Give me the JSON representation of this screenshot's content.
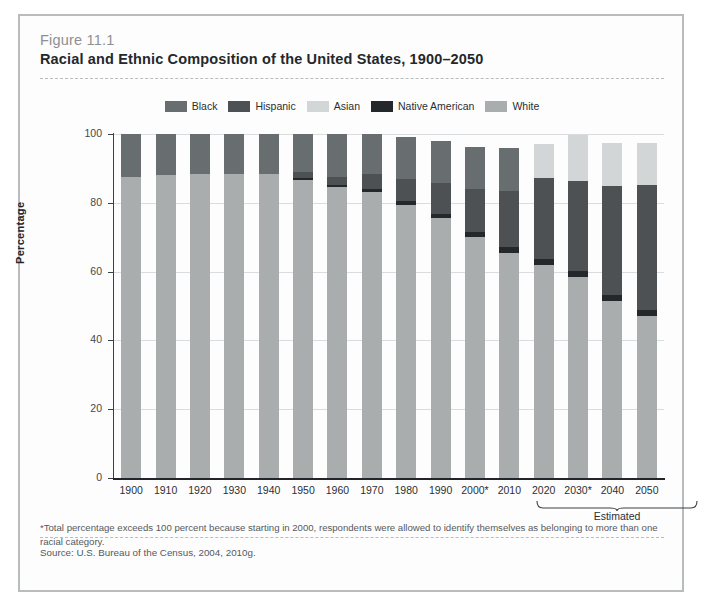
{
  "figure": {
    "number": "Figure 11.1",
    "title": "Racial and Ethnic Composition of the United States, 1900–2050",
    "footnote": "*Total percentage exceeds 100 percent because starting in 2000, respondents were allowed to identify themselves as belonging to more than one racial category.",
    "source": "Source: U.S. Bureau of the Census, 2004, 2010g.",
    "estimated_label": "Estimated"
  },
  "colors": {
    "black": "#686d70",
    "hispanic": "#4d5154",
    "asian": "#d3d6d7",
    "native_american": "#25282b",
    "white": "#a9adae",
    "frame": "#b9bcbd",
    "axis": "#22262a",
    "grid": "#dadddf"
  },
  "chart_data": {
    "type": "bar",
    "subtype": "stacked-vertical",
    "title": "Racial and Ethnic Composition of the United States, 1900–2050",
    "xlabel": "",
    "ylabel": "Percentage",
    "ylim": [
      0,
      100
    ],
    "yticks": [
      0,
      20,
      40,
      60,
      80,
      100
    ],
    "grid": true,
    "legend_position": "top-center",
    "categories": [
      "1900",
      "1910",
      "1920",
      "1930",
      "1940",
      "1950",
      "1960",
      "1970",
      "1980",
      "1990",
      "2000*",
      "2010",
      "2020",
      "2030*",
      "2040",
      "2050"
    ],
    "estimated_categories": [
      "2020",
      "2030*",
      "2040",
      "2050"
    ],
    "stack_order_bottom_to_top": [
      "White",
      "Native American",
      "Hispanic",
      "Black",
      "Asian"
    ],
    "series": [
      {
        "name": "White",
        "color": "#a9adae",
        "values": [
          87.5,
          88.0,
          88.5,
          88.5,
          88.5,
          86.5,
          84.5,
          83.0,
          79.5,
          75.5,
          70.0,
          65.5,
          62.0,
          58.5,
          51.5,
          47.0
        ]
      },
      {
        "name": "Native American",
        "color": "#25282b",
        "values": [
          0,
          0,
          0,
          0,
          0,
          0.7,
          0.8,
          0.9,
          1.0,
          1.2,
          1.5,
          1.6,
          1.6,
          1.7,
          1.8,
          1.8
        ]
      },
      {
        "name": "Hispanic",
        "color": "#4d5154",
        "values": [
          0,
          0,
          0,
          0,
          0,
          1.8,
          2.2,
          4.5,
          6.5,
          9.0,
          12.5,
          16.3,
          23.5,
          26.0,
          31.5,
          36.5
        ]
      },
      {
        "name": "Black",
        "color": "#686d70",
        "values": [
          12.5,
          12.0,
          11.5,
          11.5,
          11.5,
          11.0,
          12.5,
          11.6,
          12.0,
          12.3,
          12.3,
          12.6,
          0,
          0,
          0,
          0
        ]
      },
      {
        "name": "Asian",
        "color": "#d3d6d7",
        "values": [
          0,
          0,
          0,
          0,
          0,
          0,
          0,
          0,
          0,
          0,
          0,
          0,
          10.0,
          13.5,
          12.5,
          12.0
        ]
      }
    ]
  },
  "legend": {
    "items": [
      {
        "label": "Black",
        "color": "#686d70"
      },
      {
        "label": "Hispanic",
        "color": "#4d5154"
      },
      {
        "label": "Asian",
        "color": "#d3d6d7"
      },
      {
        "label": "Native American",
        "color": "#25282b"
      },
      {
        "label": "White",
        "color": "#a9adae"
      }
    ]
  }
}
